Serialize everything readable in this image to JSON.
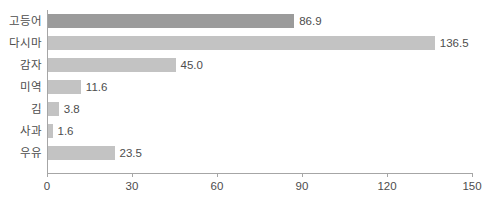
{
  "chart_data": {
    "type": "bar",
    "orientation": "horizontal",
    "title": "",
    "xlabel": "",
    "ylabel": "",
    "categories": [
      "고등어",
      "다시마",
      "감자",
      "미역",
      "김",
      "사과",
      "우유"
    ],
    "values": [
      86.9,
      136.5,
      45.0,
      11.6,
      3.8,
      1.6,
      23.5
    ],
    "value_labels": [
      "86.9",
      "136.5",
      "45.0",
      "11.6",
      "3.8",
      "1.6",
      "23.5"
    ],
    "series": [
      {
        "name": "",
        "values": [
          86.9,
          136.5,
          45.0,
          11.6,
          3.8,
          1.6,
          23.5
        ]
      }
    ],
    "xlim": [
      0,
      150
    ],
    "xticks": [
      0,
      30,
      60,
      90,
      120,
      150
    ],
    "xtick_labels": [
      "0",
      "30",
      "60",
      "90",
      "120",
      "150"
    ],
    "grid": false,
    "legend": null,
    "bar_colors": [
      "#9b9b9b",
      "#c3c3c3",
      "#c3c3c3",
      "#c3c3c3",
      "#c3c3c3",
      "#c3c3c3",
      "#c3c3c3"
    ],
    "highlight_category": "고등어",
    "axis_color": "#a6a6a6",
    "text_color": "#4d4d4d",
    "background": "#ffffff"
  }
}
